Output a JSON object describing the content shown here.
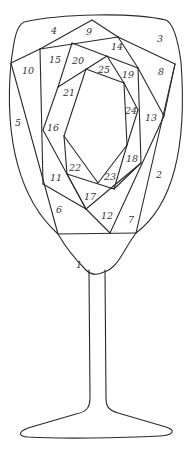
{
  "diagram": {
    "stroke_color": "#2a2a2a",
    "background": "#ffffff",
    "labels": [
      {
        "id": "1",
        "text": "1",
        "x": 79,
        "y": 265
      },
      {
        "id": "2",
        "text": "2",
        "x": 159,
        "y": 175
      },
      {
        "id": "3",
        "text": "3",
        "x": 160,
        "y": 39
      },
      {
        "id": "4",
        "text": "4",
        "x": 54,
        "y": 31
      },
      {
        "id": "5",
        "text": "5",
        "x": 18,
        "y": 123
      },
      {
        "id": "6",
        "text": "6",
        "x": 59,
        "y": 210
      },
      {
        "id": "7",
        "text": "7",
        "x": 131,
        "y": 220
      },
      {
        "id": "8",
        "text": "8",
        "x": 161,
        "y": 72
      },
      {
        "id": "9",
        "text": "9",
        "x": 89,
        "y": 32
      },
      {
        "id": "10",
        "text": "10",
        "x": 28,
        "y": 71
      },
      {
        "id": "11",
        "text": "11",
        "x": 56,
        "y": 178
      },
      {
        "id": "12",
        "text": "12",
        "x": 107,
        "y": 216
      },
      {
        "id": "13",
        "text": "13",
        "x": 151,
        "y": 118
      },
      {
        "id": "14",
        "text": "14",
        "x": 117,
        "y": 47
      },
      {
        "id": "15",
        "text": "15",
        "x": 55,
        "y": 60
      },
      {
        "id": "16",
        "text": "16",
        "x": 53,
        "y": 128
      },
      {
        "id": "17",
        "text": "17",
        "x": 90,
        "y": 197
      },
      {
        "id": "18",
        "text": "18",
        "x": 132,
        "y": 159
      },
      {
        "id": "19",
        "text": "19",
        "x": 128,
        "y": 75
      },
      {
        "id": "20",
        "text": "20",
        "x": 78,
        "y": 61
      },
      {
        "id": "21",
        "text": "21",
        "x": 69,
        "y": 93
      },
      {
        "id": "22",
        "text": "22",
        "x": 75,
        "y": 168
      },
      {
        "id": "23",
        "text": "23",
        "x": 110,
        "y": 177
      },
      {
        "id": "24",
        "text": "24",
        "x": 131,
        "y": 111
      },
      {
        "id": "25",
        "text": "25",
        "x": 104,
        "y": 70
      }
    ]
  }
}
